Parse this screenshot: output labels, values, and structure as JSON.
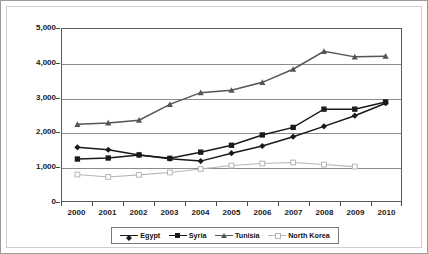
{
  "chart_data": {
    "type": "line",
    "title": "",
    "xlabel": "",
    "ylabel": "Per capita GDP/GNI ($US)",
    "categories": [
      "2000",
      "2001",
      "2002",
      "2003",
      "2004",
      "2005",
      "2006",
      "2007",
      "2008",
      "2009",
      "2010"
    ],
    "x": [
      2000,
      2001,
      2002,
      2003,
      2004,
      2005,
      2006,
      2007,
      2008,
      2009,
      2010
    ],
    "ylim": [
      0,
      5000
    ],
    "ytick_labels": [
      "0",
      "1,000",
      "2,000",
      "3,000",
      "4,000",
      "5,000"
    ],
    "ytick_values": [
      0,
      1000,
      2000,
      3000,
      4000,
      5000
    ],
    "grid": "horizontal",
    "legend_position": "bottom",
    "series": [
      {
        "name": "Egypt",
        "marker": "diamond",
        "color": "#1a1a1a",
        "values": [
          1560,
          1490,
          1340,
          1230,
          1160,
          1390,
          1600,
          1870,
          2170,
          2480,
          2840
        ]
      },
      {
        "name": "Syria",
        "marker": "filled-square",
        "color": "#1a1a1a",
        "values": [
          1220,
          1250,
          1340,
          1240,
          1420,
          1620,
          1920,
          2140,
          2670,
          2670,
          2880
        ]
      },
      {
        "name": "Tunisia",
        "marker": "triangle",
        "color": "#555555",
        "values": [
          2230,
          2270,
          2350,
          2810,
          3150,
          3220,
          3450,
          3830,
          4350,
          4190,
          4210
        ]
      },
      {
        "name": "North Korea",
        "marker": "open-square",
        "color": "#b5b5b5",
        "values": [
          770,
          700,
          760,
          830,
          930,
          1030,
          1090,
          1120,
          1060,
          1000,
          null
        ]
      }
    ]
  },
  "legend": {
    "items": [
      {
        "label": "Egypt"
      },
      {
        "label": "Syria"
      },
      {
        "label": "Tunisia"
      },
      {
        "label": "North Korea"
      }
    ]
  }
}
